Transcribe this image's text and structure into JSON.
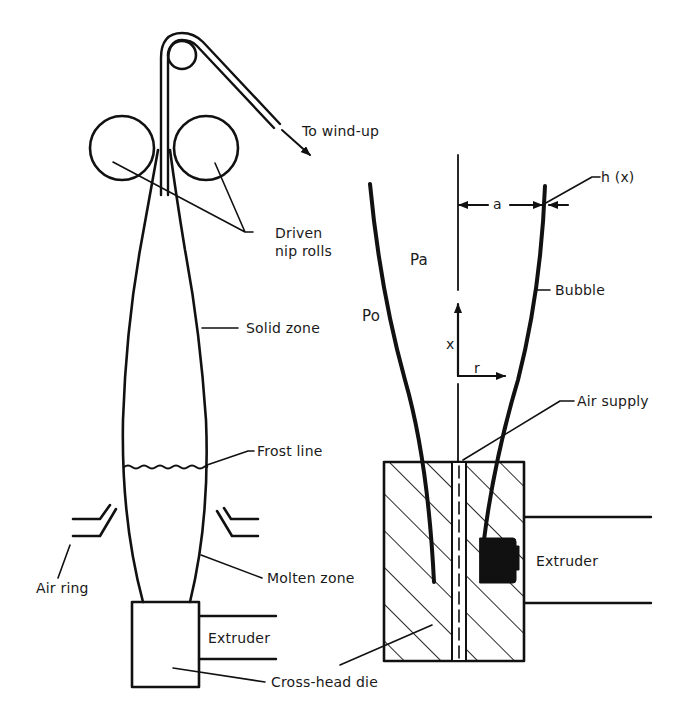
{
  "figure": {
    "left_panel": {
      "title": "Film blowing process schematic",
      "labels": {
        "wind_up": "To wind-up",
        "nip_rolls_line1": "Driven",
        "nip_rolls_line2": "nip rolls",
        "solid_zone": "Solid zone",
        "frost_line": "Frost line",
        "air_ring": "Air ring",
        "molten_zone": "Molten zone",
        "extruder": "Extruder",
        "die": "Cross-head die"
      }
    },
    "right_panel": {
      "title": "Bubble coordinate system",
      "labels": {
        "thickness": "h (x)",
        "radius": "a",
        "bubble": "Bubble",
        "inner_pressure": "Pa",
        "outer_pressure": "Po",
        "axis_x": "x",
        "axis_r": "r",
        "air_supply": "Air supply",
        "extruder": "Extruder"
      }
    },
    "colors": {
      "ink": "#111111",
      "background": "#ffffff"
    }
  }
}
